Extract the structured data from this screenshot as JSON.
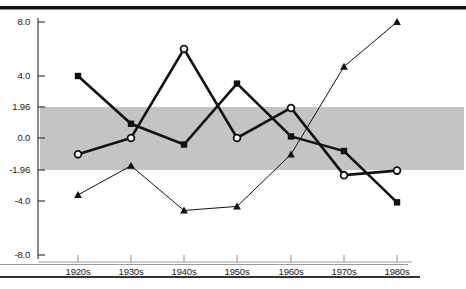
{
  "figure": {
    "kind": "scanned-journal-figure",
    "background_color": "#ffffff",
    "ink_color": "#111111",
    "band_color": "#c4c4c4"
  },
  "axis": {
    "y_tick_labels": [
      "8.0",
      "4.0",
      "1.96",
      "0.0",
      "-1.96",
      "-4.0",
      "-8.0"
    ],
    "y_tick_values": [
      8.0,
      4.0,
      1.96,
      0.0,
      -1.96,
      -4.0,
      -8.0
    ],
    "y_tick_pixels": [
      22,
      76,
      107,
      138,
      170,
      201,
      255
    ],
    "x_tick_labels": [
      "1920s",
      "1930s",
      "1940s",
      "1950s",
      "1960s",
      "1970s",
      "1980s"
    ],
    "x_tick_pixels": [
      78,
      131,
      184,
      237,
      291,
      344,
      397
    ]
  },
  "band": {
    "label": "significance band",
    "upper": 1.96,
    "lower": -1.96
  },
  "chart_data": {
    "type": "line",
    "title": "",
    "subtitle": "",
    "xlabel": "",
    "ylabel": "",
    "grid": false,
    "legend_position": "none",
    "ylim": [
      -8.0,
      8.0
    ],
    "y_scale": "piecewise-linear (breaks at ±1.96 and ±4.0)",
    "categories": [
      "1920s",
      "1930s",
      "1940s",
      "1950s",
      "1960s",
      "1970s",
      "1980s"
    ],
    "reference_bands": [
      {
        "from": -1.96,
        "to": 1.96,
        "color": "#c4c4c4"
      }
    ],
    "series": [
      {
        "name": "series-squares",
        "marker": "filled-square",
        "line_width": "thick",
        "color": "#111111",
        "values": [
          4.0,
          0.9,
          -0.4,
          3.5,
          0.1,
          -0.8,
          -4.1
        ]
      },
      {
        "name": "series-circles",
        "marker": "open-circle",
        "line_width": "thick",
        "color": "#111111",
        "values": [
          -1.0,
          0.0,
          6.0,
          0.0,
          1.9,
          -2.3,
          -2.0
        ]
      },
      {
        "name": "series-triangles",
        "marker": "filled-triangle",
        "line_width": "thin",
        "color": "#111111",
        "values": [
          -3.6,
          -1.7,
          -4.7,
          -4.4,
          -1.0,
          4.7,
          8.0
        ]
      }
    ]
  }
}
